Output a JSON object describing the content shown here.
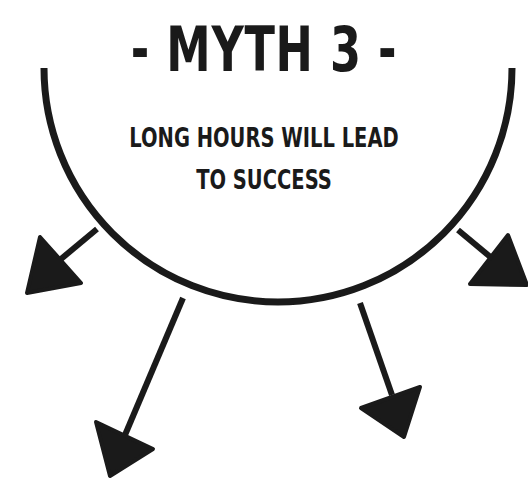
{
  "title": "- MYTH 3 -",
  "subtitle": {
    "line1": "LONG HOURS WILL LEAD",
    "line2": "TO SUCCESS"
  },
  "colors": {
    "ink": "#1a1a1a",
    "background": "#ffffff"
  },
  "arrows": [
    {
      "name": "arrow-upper-left"
    },
    {
      "name": "arrow-lower-left"
    },
    {
      "name": "arrow-lower-right"
    },
    {
      "name": "arrow-upper-right"
    }
  ]
}
